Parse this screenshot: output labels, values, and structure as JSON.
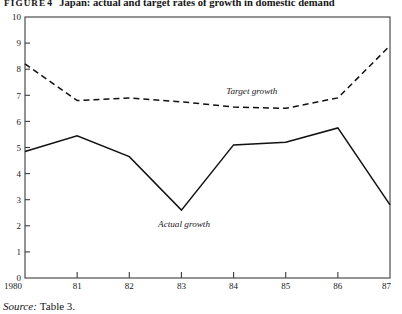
{
  "title": {
    "figure_label": "FIGURE",
    "figure_number": "4",
    "caption": "Japan: actual and target rates of growth in domestic demand"
  },
  "source": {
    "word": "Source:",
    "text": "Table 3."
  },
  "chart_data": {
    "type": "line",
    "title": "Japan: actual and target rates of growth in domestic demand",
    "xlabel": "",
    "ylabel": "",
    "x": [
      1980,
      1981,
      1982,
      1983,
      1984,
      1985,
      1986,
      1987
    ],
    "categories": [
      "1980",
      "81",
      "82",
      "83",
      "84",
      "85",
      "86",
      "87"
    ],
    "xtick_labels": [
      "1980",
      "81",
      "82",
      "83",
      "84",
      "85",
      "86",
      "87"
    ],
    "ytick_labels": [
      "0",
      "1",
      "2",
      "3",
      "4",
      "5",
      "6",
      "7",
      "8",
      "9",
      "10"
    ],
    "ylim": [
      0,
      10
    ],
    "xlim": [
      1980,
      1987
    ],
    "ytick_step": 1,
    "grid": false,
    "legend_position": "inline-annotation",
    "series": [
      {
        "name": "Target growth",
        "style": "dashed",
        "color": "#111111",
        "label_text": "Target growth",
        "label_x": 1984.35,
        "label_y": 7.05,
        "values": [
          8.2,
          6.8,
          6.9,
          6.75,
          6.55,
          6.5,
          6.9,
          8.9
        ]
      },
      {
        "name": "Actual growth",
        "style": "solid",
        "color": "#111111",
        "label_text": "Actual growth",
        "label_x": 1983.05,
        "label_y": 1.95,
        "values": [
          4.85,
          5.45,
          4.65,
          2.6,
          5.1,
          5.2,
          5.75,
          2.8
        ]
      }
    ]
  }
}
